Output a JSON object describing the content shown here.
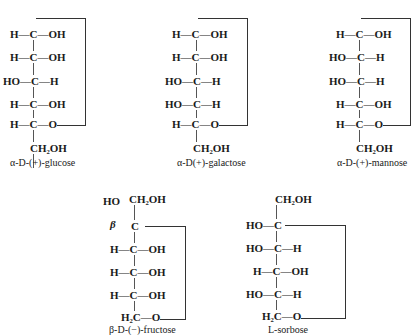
{
  "structures": [
    {
      "name": "α-D-(+)-glucose",
      "rows": [
        "H—C—OH",
        "H—C—OH",
        "HO—C—H",
        "H—C—OH",
        "H—C—O"
      ],
      "bottom": "CH₂OH"
    },
    {
      "name": "α-D(+)-galactose",
      "rows": [
        "H—C—OH",
        "H—C—OH",
        "HO—C—H",
        "HO—C—H",
        "H—C—O"
      ],
      "bottom": "CH₂OH"
    },
    {
      "name": "α-D-(+)-mannose",
      "rows": [
        "H—C—OH",
        "HO—C—H",
        "HO—C—H",
        "H—C—OH",
        "H—C—O"
      ],
      "bottom": "CH₂OH"
    },
    {
      "name": "β-D-(−)-fructose",
      "top_left": "HO",
      "top": "CH₂OH",
      "anomer_label": "β",
      "rows": [
        "C",
        "H—C—OH",
        "H—C—OH",
        "H—C—OH",
        "H₂C—O"
      ]
    },
    {
      "name": "L-sorbose",
      "top": "CH₂OH",
      "rows": [
        "HO—C",
        "HO—C—H",
        "H—C—OH",
        "HO—C—H",
        "H₂C—O"
      ]
    }
  ]
}
